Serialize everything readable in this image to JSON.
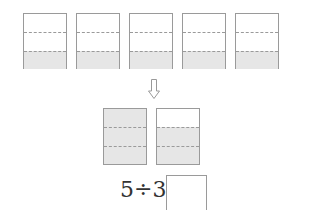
{
  "top_bars": {
    "count": 5,
    "parts_per_bar": 3,
    "shaded_parts_each": 1
  },
  "arrow": {
    "icon": "down-arrow-icon",
    "direction": "down"
  },
  "result_bars": {
    "count": 2,
    "parts_per_bar": 3,
    "shaded_parts": [
      3,
      2
    ]
  },
  "equation": {
    "text": "5÷3=",
    "answer": ""
  },
  "colors": {
    "border": "#9a9a9a",
    "shade": "#e6e6e6"
  }
}
